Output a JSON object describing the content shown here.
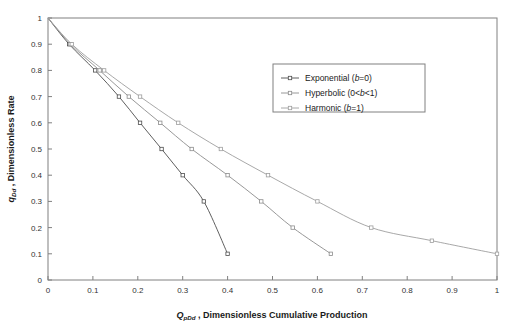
{
  "chart_data": {
    "type": "line",
    "title": "",
    "subtitle": "",
    "xlabel": "Q_pDd , Dimensionless Cumulative Production",
    "ylabel": "q_Dd , Dimensionless Rate",
    "xlabel_symbol": "Q",
    "xlabel_symbol_sub": "pDd",
    "xlabel_text": ", Dimensionless Cumulative Production",
    "ylabel_symbol": "q",
    "ylabel_symbol_sub": "Dd",
    "ylabel_text": ", Dimensionless Rate",
    "xlim": [
      0,
      1
    ],
    "ylim": [
      0,
      1
    ],
    "grid": false,
    "legend_position": "upper-right-inside",
    "xticks": [
      0,
      0.1,
      0.2,
      0.3,
      0.4,
      0.5,
      0.6,
      0.7,
      0.8,
      0.9,
      1
    ],
    "yticks": [
      0,
      0.1,
      0.2,
      0.3,
      0.4,
      0.5,
      0.6,
      0.7,
      0.8,
      0.9,
      1
    ],
    "xtick_labels": [
      "0",
      "0.1",
      "0.2",
      "0.3",
      "0.4",
      "0.5",
      "0.6",
      "0.7",
      "0.8",
      "0.9",
      "1"
    ],
    "ytick_labels": [
      "0",
      "0.1",
      "0.2",
      "0.3",
      "0.4",
      "0.5",
      "0.6",
      "0.7",
      "0.8",
      "0.9",
      "1"
    ],
    "series": [
      {
        "name": "Exponential (b=0)",
        "legend_main": "Exponential (",
        "legend_italic": "b",
        "legend_tail": "=0)",
        "color": "#4d4d4d",
        "marker": "open-square",
        "x": [
          0.0,
          0.047,
          0.105,
          0.158,
          0.205,
          0.253,
          0.3,
          0.347,
          0.4
        ],
        "y": [
          1.0,
          0.9,
          0.8,
          0.7,
          0.6,
          0.5,
          0.4,
          0.3,
          0.1
        ]
      },
      {
        "name": "Hyperbolic (0<b<1)",
        "legend_main": "Hyperbolic (0<",
        "legend_italic": "b",
        "legend_tail": "<1)",
        "color": "#8c8c8c",
        "marker": "open-square",
        "x": [
          0.0,
          0.05,
          0.115,
          0.18,
          0.25,
          0.32,
          0.4,
          0.475,
          0.545,
          0.63
        ],
        "y": [
          1.0,
          0.9,
          0.8,
          0.7,
          0.6,
          0.5,
          0.4,
          0.3,
          0.2,
          0.1
        ]
      },
      {
        "name": "Harmonic (b=1)",
        "legend_main": "Harmonic (",
        "legend_italic": "b",
        "legend_tail": "=1)",
        "color": "#9e9e9e",
        "marker": "open-square",
        "x": [
          0.0,
          0.053,
          0.125,
          0.205,
          0.29,
          0.385,
          0.49,
          0.6,
          0.72,
          0.855,
          1.0
        ],
        "y": [
          1.0,
          0.9,
          0.8,
          0.7,
          0.6,
          0.5,
          0.4,
          0.3,
          0.2,
          0.15,
          0.1
        ]
      }
    ]
  },
  "figure": {
    "background": "#ffffff",
    "frame_color": "#808080",
    "tick_color": "#808080",
    "legend_border": "#808080"
  }
}
